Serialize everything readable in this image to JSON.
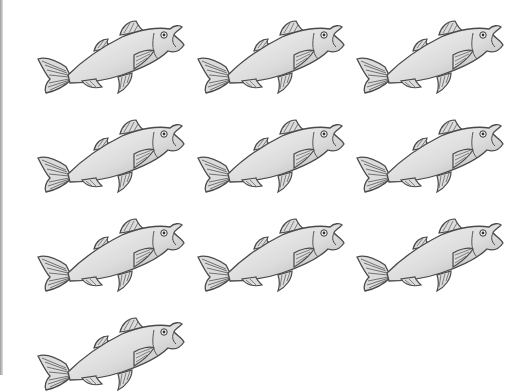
{
  "sheet": {
    "subject": "fish",
    "count": 10,
    "colors": {
      "outline": "#4a4a4a",
      "body_light": "#f4f4f4",
      "body_dark": "#b8b8b8",
      "fin": "#d8d8d8"
    },
    "items": [
      {
        "x": 36,
        "y": 17
      },
      {
        "x": 196,
        "y": 17
      },
      {
        "x": 355,
        "y": 17
      },
      {
        "x": 36,
        "y": 116
      },
      {
        "x": 196,
        "y": 116
      },
      {
        "x": 355,
        "y": 116
      },
      {
        "x": 36,
        "y": 215
      },
      {
        "x": 196,
        "y": 215
      },
      {
        "x": 355,
        "y": 215
      },
      {
        "x": 36,
        "y": 314
      }
    ]
  }
}
